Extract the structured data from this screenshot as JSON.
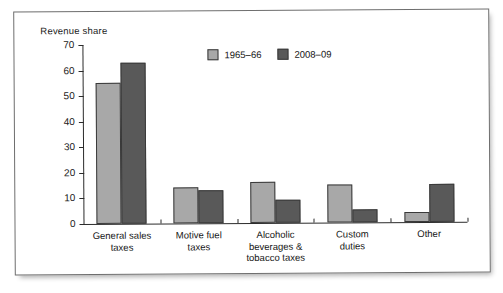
{
  "chart_data": {
    "type": "bar",
    "title": "",
    "subtitle": "",
    "xlabel": "",
    "ylabel": "Revenue share",
    "ylim": [
      0,
      70
    ],
    "y_ticks": [
      0,
      10,
      20,
      30,
      40,
      50,
      60,
      70
    ],
    "grid": false,
    "legend_position": "top-center",
    "categories": [
      "General sales taxes",
      "Motive fuel taxes",
      "Alcoholic beverages & tobacco taxes",
      "Custom duties",
      "Other"
    ],
    "category_lines": [
      [
        "General sales",
        "taxes"
      ],
      [
        "Motive fuel",
        "taxes"
      ],
      [
        "Alcoholic",
        "beverages &",
        "tobacco taxes"
      ],
      [
        "Custom",
        "duties"
      ],
      [
        "Other"
      ]
    ],
    "series": [
      {
        "name": "1965–66",
        "color": "#a8a8a8",
        "values": [
          55,
          14,
          16,
          15,
          4
        ]
      },
      {
        "name": "2008–09",
        "color": "#595959",
        "values": [
          63,
          13,
          9,
          5,
          15
        ]
      }
    ]
  },
  "colors": {
    "series_light": "#a8a8a8",
    "series_dark": "#595959",
    "axis": "#2b2b2b",
    "frame_border": "#6e6e6e",
    "background": "#ffffff",
    "text": "#141414"
  }
}
